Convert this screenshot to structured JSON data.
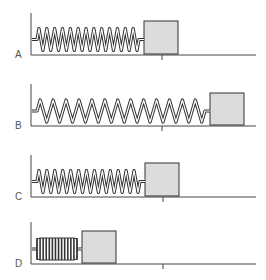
{
  "diagram": {
    "colors": {
      "line": "#444444",
      "spring_outer": "#333333",
      "spring_inner": "#ffffff",
      "block_fill": "#dcdcdc",
      "block_stroke": "#333333"
    },
    "panels": [
      {
        "label": "A",
        "state": "equilibrium",
        "top": 13,
        "floor_y": 55,
        "spring_start": 32,
        "spring_end": 144,
        "coils": 13,
        "coil_height": 22,
        "block_x": 144,
        "block_w": 34,
        "block_h": 33,
        "tick_x": 162
      },
      {
        "label": "B",
        "state": "stretched",
        "top": 84,
        "floor_y": 126,
        "spring_start": 32,
        "spring_end": 210,
        "coils": 13,
        "coil_height": 22,
        "block_x": 210,
        "block_w": 34,
        "block_h": 32,
        "tick_x": 162
      },
      {
        "label": "C",
        "state": "equilibrium",
        "top": 155,
        "floor_y": 197,
        "spring_start": 32,
        "spring_end": 145,
        "coils": 13,
        "coil_height": 22,
        "block_x": 145,
        "block_w": 34,
        "block_h": 33,
        "tick_x": 163
      },
      {
        "label": "D",
        "state": "compressed",
        "top": 222,
        "floor_y": 264,
        "spring_start": 32,
        "spring_end": 82,
        "coils": 13,
        "coil_height": 22,
        "block_x": 82,
        "block_w": 34,
        "block_h": 32,
        "tick_x": 163
      }
    ]
  }
}
